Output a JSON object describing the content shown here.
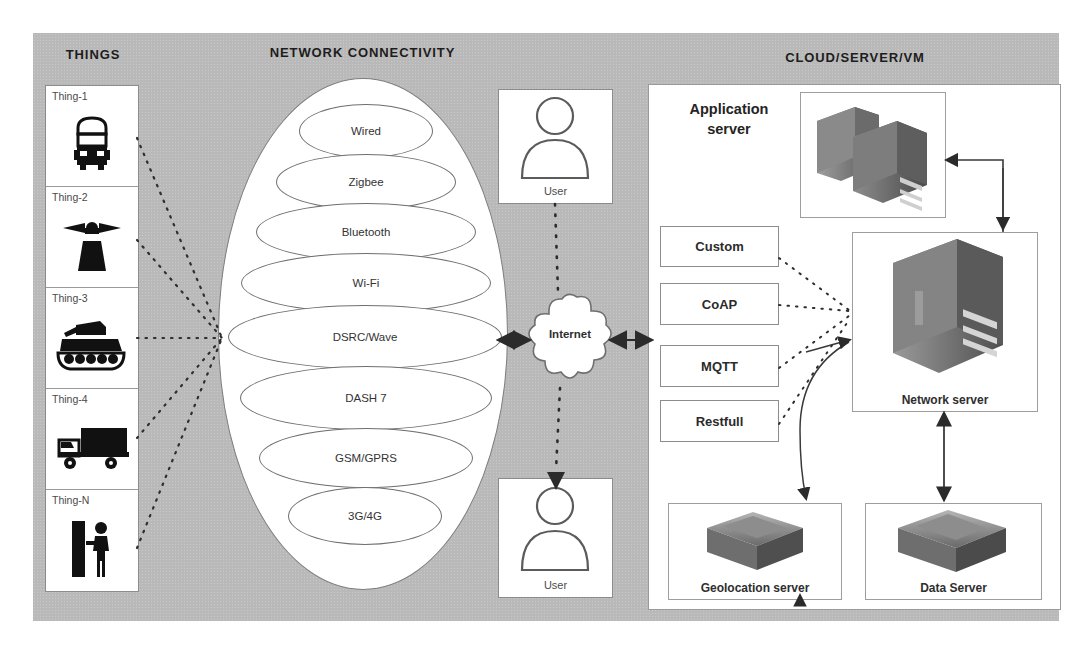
{
  "headers": {
    "things": "THINGS",
    "network": "NETWORK CONNECTIVITY",
    "cloud": "CLOUD/SERVER/VM"
  },
  "things": {
    "items": [
      {
        "label": "Thing-1",
        "icon": "bus-icon"
      },
      {
        "label": "Thing-2",
        "icon": "antenna-tower-icon"
      },
      {
        "label": "Thing-3",
        "icon": "tank-icon"
      },
      {
        "label": "Thing-4",
        "icon": "truck-icon"
      },
      {
        "label": "Thing-N",
        "icon": "person-at-barrier-icon"
      }
    ]
  },
  "network_connectivity": {
    "technologies": [
      "Wired",
      "Zigbee",
      "Bluetooth",
      "Wi-Fi",
      "DSRC/Wave",
      "DASH 7",
      "GSM/GPRS",
      "3G/4G"
    ]
  },
  "internet": {
    "label": "Internet"
  },
  "users": {
    "top_label": "User",
    "bottom_label": "User"
  },
  "cloud": {
    "application_server_label": "Application\nserver",
    "application_server_label_line1": "Application",
    "application_server_label_line2": "server",
    "protocols": [
      "Custom",
      "CoAP",
      "MQTT",
      "Restfull"
    ],
    "servers": [
      {
        "label": "Network server",
        "icon": "tower-server-icon"
      },
      {
        "label": "Geolocation server",
        "icon": "database-box-icon"
      },
      {
        "label": "Data Server",
        "icon": "database-box-icon"
      }
    ]
  },
  "colors": {
    "panel_gray": "#b9b9b9",
    "box_white": "#ffffff",
    "line_gray": "#8b8b8b",
    "text_dark": "#242424"
  }
}
